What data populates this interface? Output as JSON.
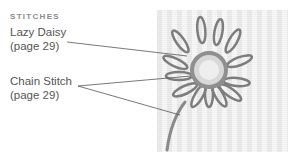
{
  "heading": "STITCHES",
  "labels": [
    {
      "name": "Lazy Daisy",
      "page": "(page 29)"
    },
    {
      "name": "Chain Stitch",
      "page": "(page 29)"
    }
  ],
  "image": {
    "subject": "embroidered-daisy-photo"
  },
  "colors": {
    "text": "#555555",
    "heading": "#8a8a8a",
    "leader": "#555555"
  }
}
